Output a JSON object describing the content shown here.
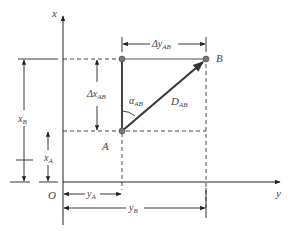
{
  "diagram": {
    "axes": {
      "x_axis_label": "x",
      "y_axis_label": "y",
      "origin_label": "O"
    },
    "points": {
      "A": "A",
      "B": "B"
    },
    "labels": {
      "delta_y": {
        "main": "Δy",
        "sub": "AB"
      },
      "delta_x": {
        "main": "Δx",
        "sub": "AB"
      },
      "alpha": {
        "main": "α",
        "sub": "AB"
      },
      "distance": {
        "main": "D",
        "sub": "AB"
      },
      "xA": {
        "main": "x",
        "sub": "A"
      },
      "xB": {
        "main": "x",
        "sub": "B"
      },
      "yA": {
        "main": "y",
        "sub": "A"
      },
      "yB": {
        "main": "y",
        "sub": "B"
      }
    },
    "colors": {
      "line": "#333333",
      "vector": "#3a3a3a",
      "point": "#777777",
      "text": "#444444"
    }
  }
}
